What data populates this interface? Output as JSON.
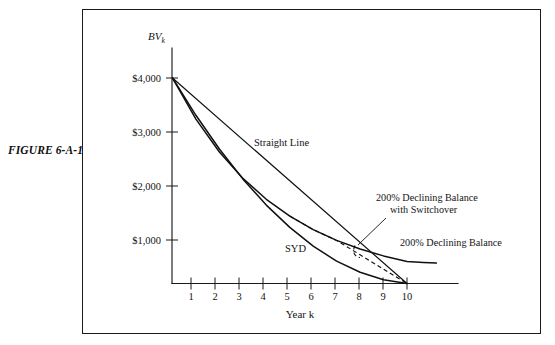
{
  "figure": {
    "label": "FIGURE 6-A-1"
  },
  "chart_data": {
    "type": "line",
    "title": "",
    "xlabel": "Year k",
    "ylabel": "BV",
    "ylabel_subscript": "k",
    "xlim": [
      0,
      11.2
    ],
    "ylim": [
      0,
      4400
    ],
    "grid": false,
    "legend_position": "inline-annotations",
    "x_ticks": [
      1,
      2,
      3,
      4,
      5,
      6,
      7,
      8,
      9,
      10
    ],
    "x_tick_labels": [
      "1",
      "2",
      "3",
      "4",
      "5",
      "6",
      "7",
      "8",
      "9",
      "10"
    ],
    "y_ticks": [
      1000,
      2000,
      3000,
      4000
    ],
    "y_tick_labels": [
      "$1,000",
      "$2,000",
      "$3,000",
      "$4,000"
    ],
    "x": [
      0,
      1,
      2,
      3,
      4,
      5,
      6,
      7,
      8,
      9,
      10
    ],
    "series": [
      {
        "name": "Straight Line",
        "label": "Straight Line",
        "style": "solid",
        "values": [
          4000,
          3600,
          3200,
          2800,
          2400,
          2000,
          1600,
          1200,
          800,
          400,
          0
        ]
      },
      {
        "name": "SYD",
        "label": "SYD",
        "style": "solid",
        "values": [
          4000,
          3273,
          2618,
          2036,
          1527,
          1091,
          727,
          436,
          218,
          73,
          0
        ]
      },
      {
        "name": "200% Declining Balance",
        "label": "200% Declining Balance",
        "style": "solid",
        "values": [
          4000,
          3200,
          2560,
          2048,
          1638,
          1311,
          1049,
          839,
          671,
          537,
          429
        ]
      },
      {
        "name": "200% Declining Balance with Switchover",
        "label": "200% Declining Balance\nwith Switchover",
        "label_line1": "200% Declining Balance",
        "label_line2": "with Switchover",
        "style": "dashed",
        "values": [
          4000,
          3200,
          2560,
          2048,
          1638,
          1311,
          1049,
          839,
          559,
          280,
          0
        ]
      }
    ]
  },
  "colors": {
    "ink": "#101010",
    "frame": "#1b1b1b",
    "paper": "#ffffff"
  }
}
